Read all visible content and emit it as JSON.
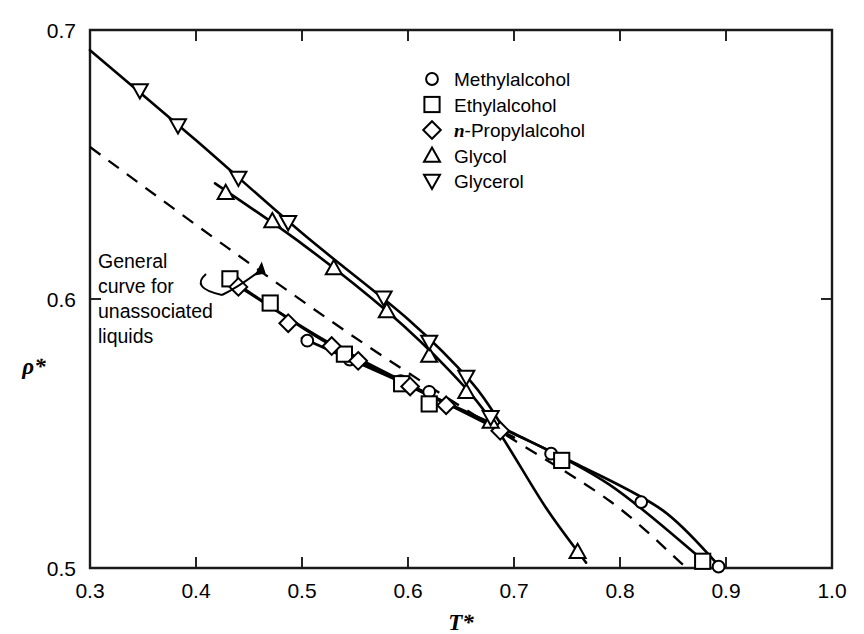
{
  "chart_data": {
    "type": "line",
    "title": "",
    "xlabel": "T*",
    "ylabel": "ρ*",
    "xlim": [
      0.3,
      1.0
    ],
    "ylim": [
      0.5,
      0.7
    ],
    "xticks": [
      "0.3",
      "0.4",
      "0.5",
      "0.6",
      "0.7",
      "0.8",
      "0.9",
      "1.0"
    ],
    "xtick_values": [
      0.3,
      0.4,
      0.5,
      0.6,
      0.7,
      0.8,
      0.9,
      1.0
    ],
    "yticks": [
      "0.5",
      "0.6",
      "0.7"
    ],
    "ytick_values": [
      0.5,
      0.6,
      0.7
    ],
    "grid": false,
    "legend_position": "upper-right",
    "series": [
      {
        "name": "Methylalcohol",
        "marker": "circle",
        "line": "solid",
        "points": [
          [
            0.505,
            0.5845
          ],
          [
            0.545,
            0.5775
          ],
          [
            0.593,
            0.5695
          ],
          [
            0.62,
            0.5655
          ],
          [
            0.735,
            0.5425
          ],
          [
            0.82,
            0.5245
          ],
          [
            0.893,
            0.5005
          ]
        ],
        "curve": [
          [
            0.5,
            0.5855
          ],
          [
            0.6,
            0.568
          ],
          [
            0.68,
            0.5535
          ],
          [
            0.76,
            0.5385
          ],
          [
            0.84,
            0.5215
          ],
          [
            0.893,
            0.501
          ]
        ]
      },
      {
        "name": "Ethylalcohol",
        "marker": "square",
        "line": "solid",
        "points": [
          [
            0.432,
            0.6075
          ],
          [
            0.47,
            0.5985
          ],
          [
            0.54,
            0.5795
          ],
          [
            0.594,
            0.5685
          ],
          [
            0.62,
            0.561
          ],
          [
            0.745,
            0.54
          ],
          [
            0.878,
            0.5025
          ]
        ],
        "curve": [
          [
            0.43,
            0.608
          ],
          [
            0.52,
            0.5845
          ],
          [
            0.62,
            0.564
          ],
          [
            0.7,
            0.55
          ],
          [
            0.79,
            0.531
          ],
          [
            0.878,
            0.503
          ]
        ]
      },
      {
        "name": "n-Propylalcohol",
        "marker": "diamond",
        "line": "solid",
        "points": [
          [
            0.44,
            0.6045
          ],
          [
            0.487,
            0.591
          ],
          [
            0.528,
            0.5825
          ],
          [
            0.553,
            0.577
          ],
          [
            0.602,
            0.5675
          ],
          [
            0.636,
            0.5605
          ],
          [
            0.687,
            0.551
          ]
        ],
        "curve": [
          [
            0.435,
            0.606
          ],
          [
            0.52,
            0.585
          ],
          [
            0.6,
            0.5685
          ],
          [
            0.68,
            0.5525
          ],
          [
            0.7,
            0.5485
          ]
        ]
      },
      {
        "name": "Glycol",
        "marker": "triangle-up",
        "line": "solid",
        "points": [
          [
            0.428,
            0.6395
          ],
          [
            0.472,
            0.629
          ],
          [
            0.53,
            0.6115
          ],
          [
            0.58,
            0.5955
          ],
          [
            0.62,
            0.579
          ],
          [
            0.655,
            0.5655
          ],
          [
            0.678,
            0.5545
          ],
          [
            0.76,
            0.506
          ]
        ],
        "curve": [
          [
            0.418,
            0.643
          ],
          [
            0.5,
            0.6205
          ],
          [
            0.58,
            0.5955
          ],
          [
            0.64,
            0.573
          ],
          [
            0.68,
            0.554
          ],
          [
            0.73,
            0.5225
          ],
          [
            0.768,
            0.502
          ]
        ]
      },
      {
        "name": "Glycerol",
        "marker": "triangle-down",
        "line": "solid",
        "points": [
          [
            0.347,
            0.6775
          ],
          [
            0.383,
            0.6645
          ],
          [
            0.44,
            0.645
          ],
          [
            0.487,
            0.6285
          ],
          [
            0.577,
            0.6005
          ],
          [
            0.62,
            0.584
          ],
          [
            0.655,
            0.571
          ],
          [
            0.678,
            0.556
          ]
        ],
        "curve": [
          [
            0.3,
            0.6925
          ],
          [
            0.4,
            0.659
          ],
          [
            0.5,
            0.6245
          ],
          [
            0.6,
            0.5925
          ],
          [
            0.66,
            0.569
          ],
          [
            0.69,
            0.552
          ]
        ]
      },
      {
        "name": "General curve for unassociated liquids",
        "marker": "none",
        "line": "dashed",
        "points": [],
        "curve": [
          [
            0.3,
            0.6565
          ],
          [
            0.43,
            0.619
          ],
          [
            0.56,
            0.583
          ],
          [
            0.68,
            0.5525
          ],
          [
            0.79,
            0.525
          ],
          [
            0.86,
            0.501
          ]
        ]
      }
    ],
    "annotations": [
      {
        "text_lines": [
          "General",
          "curve for",
          "unassociated",
          "liquids"
        ],
        "target": [
          0.462,
          0.6125
        ]
      }
    ]
  },
  "legend": {
    "entries": [
      {
        "label_pre": "",
        "label_italic": "",
        "label": "Methylalcohol",
        "marker": "circle"
      },
      {
        "label_pre": "",
        "label_italic": "",
        "label": "Ethylalcohol",
        "marker": "square"
      },
      {
        "label_pre": "",
        "label_italic": "n",
        "label": "-Propylalcohol",
        "marker": "diamond"
      },
      {
        "label_pre": "",
        "label_italic": "",
        "label": "Glycol",
        "marker": "triangle-up"
      },
      {
        "label_pre": "",
        "label_italic": "",
        "label": "Glycerol",
        "marker": "triangle-down"
      }
    ]
  },
  "annotation": {
    "line1": "General",
    "line2": "curve for",
    "line3": "unassociated",
    "line4": "liquids"
  },
  "axes": {
    "x_title": "T*",
    "y_title": "ρ*",
    "x_labels": [
      "0.3",
      "0.4",
      "0.5",
      "0.6",
      "0.7",
      "0.8",
      "0.9",
      "1.0"
    ],
    "y_labels": [
      "0.7",
      "0.6",
      "0.5"
    ]
  },
  "colors": {
    "ink": "#000000",
    "axis": "#1a1a1a",
    "paper": "#ffffff"
  }
}
